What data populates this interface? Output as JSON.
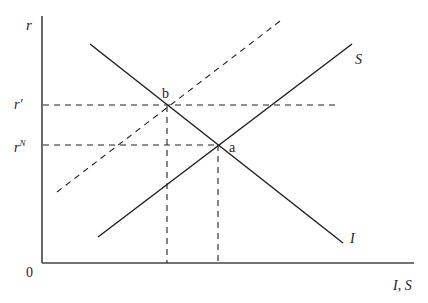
{
  "diagram": {
    "axes": {
      "y_label": "r",
      "x_label": "I, S",
      "origin_label": "0"
    },
    "rate_labels": {
      "r_prime": "r′",
      "r_natural_base": "r",
      "r_natural_sup": "N"
    },
    "curves": {
      "saving": {
        "label": "S",
        "style": "solid"
      },
      "investment": {
        "label": "I",
        "style": "solid"
      },
      "saving_shifted": {
        "label": "",
        "style": "dashed"
      }
    },
    "points": {
      "a": "a",
      "b": "b"
    },
    "colors": {
      "line": "#222222",
      "axis": "#444444",
      "background": "#ffffff"
    }
  }
}
